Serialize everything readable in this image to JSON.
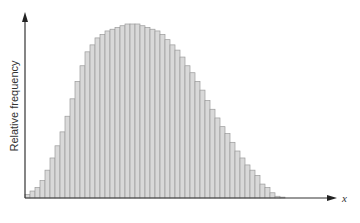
{
  "chart_data": {
    "type": "bar",
    "title": "",
    "xlabel": "x",
    "ylabel": "Relative frequency",
    "grid": false,
    "legend": null,
    "x_ticks": [],
    "y_ticks": [],
    "bar_width_px": 5,
    "baseline_px": 198,
    "origin_x_px": 25,
    "ylim": [
      0,
      1
    ],
    "values": [
      0.02,
      0.04,
      0.06,
      0.1,
      0.16,
      0.23,
      0.3,
      0.38,
      0.47,
      0.57,
      0.67,
      0.76,
      0.84,
      0.88,
      0.92,
      0.94,
      0.96,
      0.97,
      0.98,
      0.99,
      1.0,
      1.0,
      1.0,
      0.99,
      0.98,
      0.97,
      0.96,
      0.94,
      0.91,
      0.88,
      0.85,
      0.81,
      0.76,
      0.72,
      0.67,
      0.62,
      0.56,
      0.51,
      0.46,
      0.41,
      0.37,
      0.32,
      0.27,
      0.23,
      0.19,
      0.16,
      0.13,
      0.08,
      0.06,
      0.03,
      0.01,
      0.005
    ],
    "colors": {
      "bar_fill": "#d9d9d9",
      "bar_edge": "#9a9a9a",
      "axis": "#333333"
    }
  },
  "axes": {
    "x_label": "x",
    "y_label": "Relative frequency"
  }
}
